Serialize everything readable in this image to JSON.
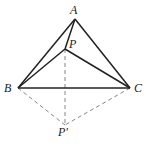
{
  "diagram": {
    "type": "geometry",
    "points": {
      "A": {
        "label": "A",
        "x": 75,
        "y": 19
      },
      "B": {
        "label": "B",
        "x": 18,
        "y": 88
      },
      "C": {
        "label": "C",
        "x": 130,
        "y": 88
      },
      "P": {
        "label": "P",
        "x": 65,
        "y": 49
      },
      "P_prime": {
        "label": "P'",
        "x": 65,
        "y": 125
      }
    },
    "solid_segments": [
      [
        "A",
        "B"
      ],
      [
        "A",
        "C"
      ],
      [
        "B",
        "C"
      ],
      [
        "A",
        "P"
      ],
      [
        "B",
        "P"
      ],
      [
        "C",
        "P"
      ]
    ],
    "dashed_segments": [
      [
        "B",
        "P'"
      ],
      [
        "C",
        "P'"
      ],
      [
        "P",
        "P'"
      ]
    ],
    "colors": {
      "solid": "#222222",
      "dashed": "#888888"
    }
  }
}
